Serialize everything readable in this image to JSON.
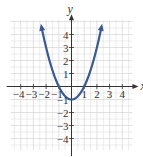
{
  "chart_data": {
    "type": "line",
    "title": "",
    "function": "y = x^2 - 1",
    "xlabel": "x",
    "ylabel": "y",
    "xlim": [
      -4.8,
      4.8
    ],
    "ylim": [
      -4.8,
      5
    ],
    "grid": true,
    "x_ticks": [
      -4,
      -3,
      -2,
      -1,
      1,
      2,
      3,
      4
    ],
    "y_ticks": [
      4,
      3,
      2,
      1,
      -1,
      -2,
      -3,
      -4
    ],
    "x_tick_labels": [
      "-4",
      "-3",
      "-2",
      "-1",
      "1",
      "2",
      "3",
      "4"
    ],
    "y_tick_labels": [
      "4",
      "3",
      "2",
      "1",
      "-1",
      "-2",
      "-3",
      "-4"
    ],
    "series": [
      {
        "name": "parabola",
        "color": "#3b5a8f",
        "x": [
          -2.4,
          -2,
          -1.5,
          -1,
          -0.5,
          0,
          0.5,
          1,
          1.5,
          2,
          2.4
        ],
        "y": [
          4.76,
          3,
          1.25,
          0,
          -0.75,
          -1,
          -0.75,
          0,
          1.25,
          3,
          4.76
        ]
      }
    ],
    "annotations": [
      "arrowheads at both ends of curve"
    ]
  },
  "colors": {
    "curve": "#3b5a8f",
    "grid": "#d9d9d9",
    "axis": "#333333"
  }
}
